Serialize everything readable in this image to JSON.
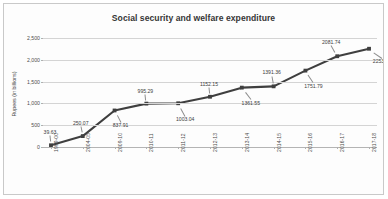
{
  "chart_data": {
    "type": "line",
    "title": "Social security and welfare expenditure",
    "xlabel": "",
    "ylabel": "Rupees (in billions)",
    "ylim": [
      0,
      2500
    ],
    "grid": true,
    "legend": false,
    "series_color": "#3f3f3f",
    "categories": [
      "1999-00",
      "2004-05",
      "2009-10",
      "2010-11",
      "2011-12",
      "2012-13",
      "2013-14",
      "2014-15",
      "2015-16",
      "2016-17",
      "2017-18"
    ],
    "values": [
      39.63,
      250.07,
      837.91,
      995.29,
      1003.04,
      1152.15,
      1361.55,
      1391.36,
      1751.79,
      2081.74,
      2253.74
    ],
    "point_labels": [
      "39.63",
      "250.07",
      "837.91",
      "995.29",
      "1003.04",
      "1152.15",
      "1361.55",
      "1391.36",
      "1751.79",
      "2081.74",
      "2253.74"
    ],
    "ytick_labels": [
      "0",
      "500",
      "1,000",
      "1,500",
      "2,000",
      "2,500"
    ],
    "ytick_values": [
      0,
      500,
      1000,
      1500,
      2000,
      2500
    ]
  }
}
